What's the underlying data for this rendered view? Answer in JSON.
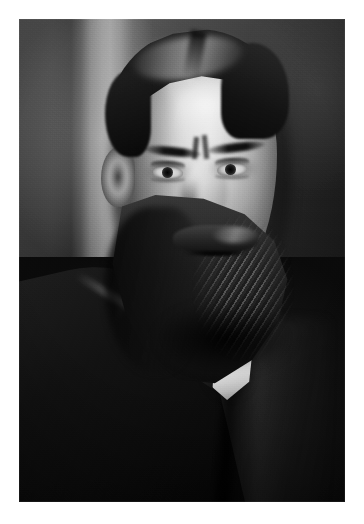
{
  "page": {
    "background_color": "#ffffff",
    "width": 364,
    "height": 524,
    "caption": ""
  },
  "photograph": {
    "title": "",
    "medium": "black-and-white photographic print",
    "subject": "bearded man in dark suit and white collar, three-quarter portrait",
    "orientation": "portrait",
    "frame": {
      "left": 19,
      "top": 19,
      "width": 326,
      "height": 483
    },
    "palette": {
      "paper": "#ffffff",
      "backdrop_light": "#96989c",
      "backdrop_dark": "#1e1e20",
      "skin_highlight": "#e6e4df",
      "hair_dark": "#1d1a16",
      "beard_mid": "#2b2621",
      "suit_black": "#0a0a0c",
      "collar_white": "#f1f1ef"
    },
    "regions": {
      "backdrop": "studio backdrop with vertical light strip left of head",
      "hair": "dark hair swept back with centre-left part and high forehead",
      "face": "lit from viewer-right, furrowed brow, direct gaze",
      "eyes": "both eyes open, heavy lids, dark irises",
      "nose": "straight nose with highlighted bridge",
      "moustache": "full moustache over mouth line",
      "beard": "long full beard covering jaw and chin",
      "ear": "left ear visible in shadow",
      "collar": "bright white stand collar wedge below beard",
      "suit": "dark jacket with lapel edge highlight across left shoulder"
    }
  }
}
